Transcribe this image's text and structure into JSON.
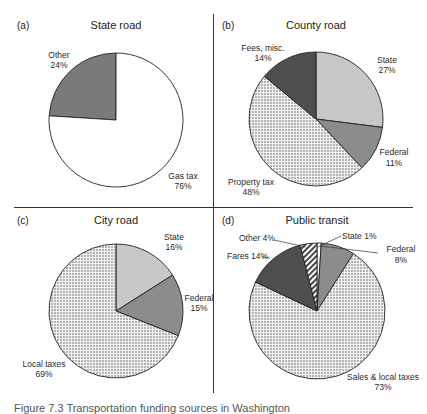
{
  "caption": "Figure 7.3  Transportation funding sources in Washington",
  "colors": {
    "white": "#ffffff",
    "light_gray": "#c8c8c8",
    "mid_gray": "#8c8c8c",
    "dark_gray": "#505050",
    "other_gray": "#7a7a7a",
    "outline": "#222222"
  },
  "panels": [
    {
      "letter": "(a)",
      "title": "State road"
    },
    {
      "letter": "(b)",
      "title": "County road"
    },
    {
      "letter": "(c)",
      "title": "City road"
    },
    {
      "letter": "(d)",
      "title": "Public transit"
    }
  ],
  "chart_data": [
    {
      "type": "pie",
      "title": "State road",
      "panel": "(a)",
      "categories": [
        "Gas tax",
        "Other"
      ],
      "values": [
        76,
        24
      ],
      "labels": [
        {
          "name": "Other",
          "value": "24%"
        },
        {
          "name": "Gas tax",
          "value": "76%"
        }
      ],
      "fills": [
        "white",
        "gray"
      ]
    },
    {
      "type": "pie",
      "title": "County road",
      "panel": "(b)",
      "categories": [
        "State",
        "Federal",
        "Property tax",
        "Fees, misc."
      ],
      "values": [
        27,
        11,
        48,
        14
      ],
      "labels": [
        {
          "name": "State",
          "value": "27%"
        },
        {
          "name": "Federal",
          "value": "11%"
        },
        {
          "name": "Property tax",
          "value": "48%"
        },
        {
          "name": "Fees, misc.",
          "value": "14%"
        }
      ],
      "fills": [
        "light gray",
        "mid gray",
        "dotted",
        "dark gray"
      ]
    },
    {
      "type": "pie",
      "title": "City road",
      "panel": "(c)",
      "categories": [
        "State",
        "Federal",
        "Local taxes"
      ],
      "values": [
        16,
        15,
        69
      ],
      "labels": [
        {
          "name": "State",
          "value": "16%"
        },
        {
          "name": "Federal",
          "value": "15%"
        },
        {
          "name": "Local taxes",
          "value": "69%"
        }
      ],
      "fills": [
        "light gray",
        "mid gray",
        "dotted"
      ]
    },
    {
      "type": "pie",
      "title": "Public transit",
      "panel": "(d)",
      "categories": [
        "State",
        "Federal",
        "Sales & local taxes",
        "Fares",
        "Other"
      ],
      "values": [
        1,
        8,
        73,
        14,
        4
      ],
      "labels": [
        {
          "name": "State",
          "value": "1%",
          "text": "State 1%"
        },
        {
          "name": "Federal",
          "value": "8%"
        },
        {
          "name": "Sales & local taxes",
          "value": "73%"
        },
        {
          "name": "Fares",
          "value": "14%",
          "text": "Fares 14%"
        },
        {
          "name": "Other",
          "value": "4%",
          "text": "Other 4%"
        }
      ],
      "fills": [
        "white",
        "mid gray",
        "dotted",
        "dark gray",
        "hatched"
      ]
    }
  ]
}
